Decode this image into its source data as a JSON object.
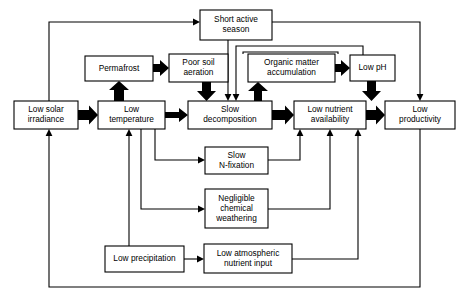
{
  "diagram": {
    "canvas": {
      "width": 474,
      "height": 305,
      "background": "#ffffff",
      "line_color": "#000000"
    },
    "nodes": [
      {
        "id": "short_active_season",
        "label_line1": "Short active",
        "label_line2": "season",
        "x": 200,
        "y": 10,
        "w": 72,
        "h": 30
      },
      {
        "id": "permafrost",
        "label_line1": "Permafrost",
        "label_line2": "",
        "x": 85,
        "y": 56,
        "w": 68,
        "h": 25
      },
      {
        "id": "poor_soil_aeration",
        "label_line1": "Poor soil",
        "label_line2": "aeration",
        "x": 169,
        "y": 54,
        "w": 59,
        "h": 28
      },
      {
        "id": "organic_matter_accumulation",
        "label_line1": "Organic matter",
        "label_line2": "accumulation",
        "x": 248,
        "y": 54,
        "w": 87,
        "h": 28
      },
      {
        "id": "low_ph",
        "label_line1": "Low pH",
        "label_line2": "",
        "x": 350,
        "y": 55,
        "w": 45,
        "h": 26
      },
      {
        "id": "low_solar_irradiance",
        "label_line1": "Low solar",
        "label_line2": "irradiance",
        "x": 14,
        "y": 101,
        "w": 64,
        "h": 28
      },
      {
        "id": "low_temperature",
        "label_line1": "Low",
        "label_line2": "temperature",
        "x": 98,
        "y": 101,
        "w": 67,
        "h": 28
      },
      {
        "id": "slow_decomposition",
        "label_line1": "Slow",
        "label_line2": "decomposition",
        "x": 188,
        "y": 101,
        "w": 84,
        "h": 28
      },
      {
        "id": "low_nutrient_availability",
        "label_line1": "Low nutrient",
        "label_line2": "availability",
        "x": 294,
        "y": 101,
        "w": 72,
        "h": 28
      },
      {
        "id": "low_productivity",
        "label_line1": "Low",
        "label_line2": "productivity",
        "x": 385,
        "y": 101,
        "w": 70,
        "h": 28
      },
      {
        "id": "slow_n_fixation",
        "label_line1": "Slow",
        "label_line2": "N-fixation",
        "x": 205,
        "y": 147,
        "w": 63,
        "h": 27
      },
      {
        "id": "negligible_chemical_weathering",
        "label_line1": "Negligible",
        "label_line2": "chemical",
        "label_line3": "weathering",
        "x": 205,
        "y": 189,
        "w": 63,
        "h": 39
      },
      {
        "id": "low_precipitation",
        "label_line1": "Low precipitation",
        "label_line2": "",
        "x": 105,
        "y": 246,
        "w": 79,
        "h": 26
      },
      {
        "id": "low_atmospheric_nutrient_input",
        "label_line1": "Low atmospheric",
        "label_line2": "nutrient input",
        "x": 204,
        "y": 244,
        "w": 88,
        "h": 29
      }
    ],
    "edges": [
      {
        "from": "low_solar_irradiance",
        "to": "low_temperature",
        "style": "thick"
      },
      {
        "from": "low_temperature",
        "to": "slow_decomposition",
        "style": "thick"
      },
      {
        "from": "slow_decomposition",
        "to": "low_nutrient_availability",
        "style": "thick"
      },
      {
        "from": "low_nutrient_availability",
        "to": "low_productivity",
        "style": "thick"
      },
      {
        "from": "low_temperature",
        "to": "permafrost",
        "style": "thick"
      },
      {
        "from": "permafrost",
        "to": "poor_soil_aeration",
        "style": "thick"
      },
      {
        "from": "poor_soil_aeration",
        "to": "slow_decomposition",
        "style": "thick"
      },
      {
        "from": "slow_decomposition",
        "to": "organic_matter_accumulation",
        "style": "thick"
      },
      {
        "from": "organic_matter_accumulation",
        "to": "low_ph",
        "style": "thick"
      },
      {
        "from": "low_ph",
        "to": "low_nutrient_availability",
        "style": "thick"
      },
      {
        "from": "low_solar_irradiance",
        "to": "short_active_season",
        "style": "thin"
      },
      {
        "from": "short_active_season",
        "to": "slow_decomposition",
        "style": "thin"
      },
      {
        "from": "short_active_season",
        "to": "low_productivity",
        "style": "thin"
      },
      {
        "from": "low_ph",
        "to": "slow_decomposition",
        "style": "thin"
      },
      {
        "from": "low_temperature",
        "to": "slow_n_fixation",
        "style": "thin"
      },
      {
        "from": "low_temperature",
        "to": "negligible_chemical_weathering",
        "style": "thin"
      },
      {
        "from": "slow_n_fixation",
        "to": "low_nutrient_availability",
        "style": "thin"
      },
      {
        "from": "negligible_chemical_weathering",
        "to": "low_nutrient_availability",
        "style": "thin"
      },
      {
        "from": "low_precipitation",
        "to": "low_temperature",
        "style": "thin"
      },
      {
        "from": "low_precipitation",
        "to": "low_atmospheric_nutrient_input",
        "style": "thin"
      },
      {
        "from": "low_atmospheric_nutrient_input",
        "to": "low_nutrient_availability",
        "style": "thin"
      },
      {
        "from": "low_productivity",
        "to": "low_solar_irradiance",
        "style": "thin"
      }
    ]
  }
}
